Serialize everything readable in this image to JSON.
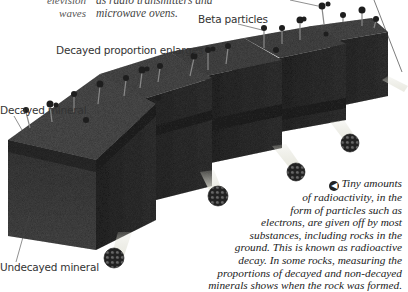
{
  "captions": {
    "top_left_partial": [
      "elevision",
      "waves"
    ],
    "top_middle_partial": [
      "as radio transmitters and",
      "microwave ovens."
    ],
    "main_caption": [
      "Tiny amounts",
      "of radioactivity, in the",
      "form of particles such as",
      "electrons, are given off by most",
      "substances, including rocks in the",
      "ground. This is known as radioactive",
      "decay. In some rocks, measuring the",
      "proportions of decayed and non-decayed",
      "minerals shows when the rock was formed."
    ],
    "bullet_icon": "left-arrow-bullet-icon"
  },
  "labels": {
    "beta_particles": "Beta particles",
    "decayed_proportion": "Decayed proportion enlarges",
    "decayed_mineral": "Decayed mineral",
    "undecayed_mineral": "Undecayed mineral"
  },
  "illustration": {
    "subject": "rock cubes emitting radioactive particles",
    "cube_count": 5,
    "colors": {
      "cube_top": "#4a4a4a",
      "cube_front": "#3a3a3a",
      "cube_side": "#2c2c2c",
      "band": "#262626",
      "particle": "#1e1e1e",
      "leader_line": "#444444"
    }
  }
}
